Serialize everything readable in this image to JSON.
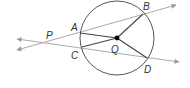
{
  "diagram": {
    "type": "circle-geometry",
    "labels": {
      "P": "P",
      "A": "A",
      "B": "B",
      "C": "C",
      "D": "D",
      "Q": "Q"
    },
    "circle": {
      "center": [
        117,
        38
      ],
      "radius": 37,
      "stroke": "#555555"
    },
    "points": {
      "P": [
        42,
        43
      ],
      "A": [
        80,
        33
      ],
      "B": [
        143,
        14
      ],
      "C": [
        82,
        47
      ],
      "D": [
        147,
        58
      ],
      "Q": [
        117,
        38
      ]
    },
    "lines": [
      {
        "name": "line-PAB",
        "from": [
          17,
          50
        ],
        "to": [
          176,
          5
        ],
        "through": [
          "P",
          "A",
          "B"
        ],
        "arrows": "both"
      },
      {
        "name": "line-PCD",
        "from": [
          17,
          39
        ],
        "to": [
          179,
          62
        ],
        "through": [
          "P",
          "C",
          "D"
        ],
        "arrows": "both"
      }
    ],
    "segments": [
      {
        "name": "QA",
        "from": "Q",
        "to": "A"
      },
      {
        "name": "QB",
        "from": "Q",
        "to": "B"
      },
      {
        "name": "QC",
        "from": "Q",
        "to": "C"
      },
      {
        "name": "QD",
        "from": "Q",
        "to": "D"
      }
    ],
    "colors": {
      "secant_line": "#aaaaaa",
      "arrowhead": "#999999",
      "circle": "#555555",
      "radius": "#444444",
      "center_dot": "#000000",
      "label": "#333333"
    }
  }
}
